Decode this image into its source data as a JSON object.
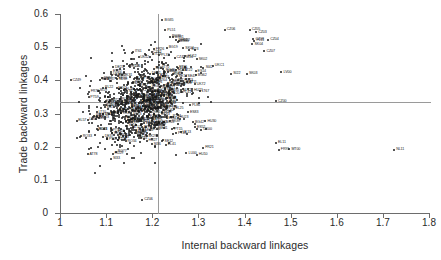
{
  "chart_data": {
    "type": "scatter",
    "title": "",
    "xlabel": "Internal backward linkages",
    "ylabel": "Trade backward linkages",
    "xlim": [
      1,
      1.8
    ],
    "ylim": [
      0,
      0.6
    ],
    "xticks": [
      "1",
      "1.1",
      "1.2",
      "1.3",
      "1.4",
      "1.5",
      "1.6",
      "1.7",
      "1.8"
    ],
    "yticks": [
      "0",
      "0.1",
      "0.2",
      "0.3",
      "0.4",
      "0.5",
      "0.6"
    ],
    "grid": false,
    "legend": null,
    "reference_lines": [
      {
        "orientation": "horizontal",
        "value": 0.335,
        "color": "#9a9a9a"
      },
      {
        "orientation": "vertical",
        "value": 1.212,
        "color": "#9a9a9a"
      }
    ],
    "marker_color": "#1c1c1c",
    "labeled_points": [
      {
        "label": "BG35",
        "x": 1.222,
        "y": 0.581
      },
      {
        "label": "PL51",
        "x": 1.228,
        "y": 0.551
      },
      {
        "label": "CZ06",
        "x": 1.357,
        "y": 0.553
      },
      {
        "label": "CZ05",
        "x": 1.411,
        "y": 0.553
      },
      {
        "label": "CZ03",
        "x": 1.425,
        "y": 0.545
      },
      {
        "label": "RO36",
        "x": 1.238,
        "y": 0.532
      },
      {
        "label": "BG31",
        "x": 1.244,
        "y": 0.53
      },
      {
        "label": "CZ08",
        "x": 1.419,
        "y": 0.524
      },
      {
        "label": "PL11",
        "x": 1.421,
        "y": 0.519
      },
      {
        "label": "CZ04",
        "x": 1.451,
        "y": 0.522
      },
      {
        "label": "RO31",
        "x": 1.252,
        "y": 0.521
      },
      {
        "label": "HU22",
        "x": 1.258,
        "y": 0.519
      },
      {
        "label": "BG33",
        "x": 1.255,
        "y": 0.517
      },
      {
        "label": "SK04",
        "x": 1.417,
        "y": 0.509
      },
      {
        "label": "BG19",
        "x": 1.231,
        "y": 0.498
      },
      {
        "label": "SK04b",
        "x": 1.267,
        "y": 0.497
      },
      {
        "label": "SI23",
        "x": 1.28,
        "y": 0.492
      },
      {
        "label": "CZ07",
        "x": 1.443,
        "y": 0.487
      },
      {
        "label": "PL33",
        "x": 1.215,
        "y": 0.475
      },
      {
        "label": "HU12",
        "x": 1.272,
        "y": 0.472
      },
      {
        "label": "SI14",
        "x": 1.268,
        "y": 0.468
      },
      {
        "label": "SK02",
        "x": 1.296,
        "y": 0.464
      },
      {
        "label": "UKC1",
        "x": 1.331,
        "y": 0.443
      },
      {
        "label": "SI42",
        "x": 1.311,
        "y": 0.437
      },
      {
        "label": "LV00",
        "x": 1.48,
        "y": 0.424
      },
      {
        "label": "SI22",
        "x": 1.371,
        "y": 0.42
      },
      {
        "label": "SK03",
        "x": 1.405,
        "y": 0.419
      },
      {
        "label": "UKM0",
        "x": 1.11,
        "y": 0.418
      },
      {
        "label": "EE00",
        "x": 1.122,
        "y": 0.406
      },
      {
        "label": "IE01",
        "x": 1.086,
        "y": 0.402
      },
      {
        "label": "LT00",
        "x": 1.219,
        "y": 0.382
      },
      {
        "label": "PL22",
        "x": 1.093,
        "y": 0.378
      },
      {
        "label": "NL12",
        "x": 1.262,
        "y": 0.37
      },
      {
        "label": "HU21",
        "x": 1.286,
        "y": 0.368
      },
      {
        "label": "CY00",
        "x": 1.225,
        "y": 0.365
      },
      {
        "label": "CZ00",
        "x": 1.468,
        "y": 0.337
      },
      {
        "label": "EL23",
        "x": 1.084,
        "y": 0.287
      },
      {
        "label": "IT02",
        "x": 1.093,
        "y": 0.297
      },
      {
        "label": "SE33",
        "x": 1.204,
        "y": 0.265
      },
      {
        "label": "SE31",
        "x": 1.21,
        "y": 0.253
      },
      {
        "label": "PT15",
        "x": 1.243,
        "y": 0.252
      },
      {
        "label": "PT18",
        "x": 1.251,
        "y": 0.24
      },
      {
        "label": "ES52",
        "x": 1.292,
        "y": 0.258
      },
      {
        "label": "UK00",
        "x": 1.306,
        "y": 0.251
      },
      {
        "label": "BG42",
        "x": 1.288,
        "y": 0.273
      },
      {
        "label": "HU30",
        "x": 1.315,
        "y": 0.276
      },
      {
        "label": "SE12",
        "x": 1.222,
        "y": 0.216
      },
      {
        "label": "EL41",
        "x": 1.229,
        "y": 0.206
      },
      {
        "label": "FR21",
        "x": 1.31,
        "y": 0.197
      },
      {
        "label": "LU00",
        "x": 1.274,
        "y": 0.18
      },
      {
        "label": "HU10",
        "x": 1.296,
        "y": 0.176
      },
      {
        "label": "EL11",
        "x": 1.468,
        "y": 0.212
      },
      {
        "label": "MT00",
        "x": 1.497,
        "y": 0.192
      },
      {
        "label": "FR91",
        "x": 1.474,
        "y": 0.191
      },
      {
        "label": "NL11",
        "x": 1.724,
        "y": 0.19
      },
      {
        "label": "CZ06b",
        "x": 1.178,
        "y": 0.04
      }
    ],
    "n_points_approx": 900
  }
}
